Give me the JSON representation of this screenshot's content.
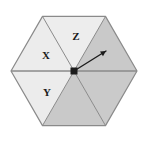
{
  "figure": {
    "name": "hexagon-sector-diagram",
    "type": "geometric-diagram",
    "background_color": "#ffffff",
    "outline_color": "#8a8a8a",
    "divider_color": "#8a8a8a",
    "marker_color": "#1b1b1b"
  },
  "hexagon": {
    "center": {
      "x": 74,
      "y": 71
    },
    "circumradius": 63,
    "orientation": "flat-top-pointy-side",
    "vertices": [
      {
        "name": "left",
        "x": 11,
        "y": 71
      },
      {
        "name": "top-left",
        "x": 42.5,
        "y": 16.4
      },
      {
        "name": "top-right",
        "x": 105.5,
        "y": 16.4
      },
      {
        "name": "right",
        "x": 137,
        "y": 71
      },
      {
        "name": "bottom-right",
        "x": 105.5,
        "y": 125.6
      },
      {
        "name": "bottom-left",
        "x": 42.5,
        "y": 125.6
      }
    ]
  },
  "sectors": [
    {
      "id": "upper-left",
      "label": "X",
      "label_x": 46,
      "label_y": 56,
      "fill": "#ececec",
      "shade": "light"
    },
    {
      "id": "top",
      "label": "Z",
      "label_x": 76,
      "label_y": 37,
      "fill": "#ededed",
      "shade": "light"
    },
    {
      "id": "upper-right",
      "label": "",
      "label_x": 0,
      "label_y": 0,
      "fill": "#c9c9c9",
      "shade": "dark"
    },
    {
      "id": "lower-right",
      "label": "",
      "label_x": 0,
      "label_y": 0,
      "fill": "#cacaca",
      "shade": "dark"
    },
    {
      "id": "bottom",
      "label": "",
      "label_x": 0,
      "label_y": 0,
      "fill": "#c9c9c9",
      "shade": "dark"
    },
    {
      "id": "lower-left",
      "label": "Y",
      "label_x": 47,
      "label_y": 93,
      "fill": "#ececec",
      "shade": "light"
    }
  ],
  "annotations": {
    "center_dot": {
      "name": "center-point",
      "x": 74,
      "y": 71,
      "size": 7,
      "color": "#1b1b1b"
    },
    "arrow": {
      "name": "direction-arrow",
      "from_x": 74,
      "from_y": 71,
      "to_x": 106,
      "to_y": 51,
      "color": "#1b1b1b",
      "stroke_width": 1.4,
      "head_size": 6
    },
    "diameter_line": {
      "name": "horizontal-diameter",
      "x1": 11,
      "y1": 71,
      "x2": 137,
      "y2": 71,
      "color": "#8a8a8a"
    }
  }
}
